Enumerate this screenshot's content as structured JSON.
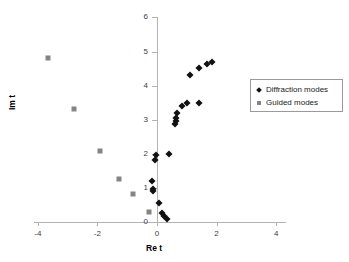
{
  "chart_data": {
    "type": "scatter",
    "title": "",
    "xlabel": "Re t",
    "ylabel": "Im t",
    "xlim": [
      -4,
      4
    ],
    "ylim": [
      0,
      6
    ],
    "xticks": [
      -4,
      -2,
      0,
      2,
      4
    ],
    "yticks": [
      0,
      1,
      2,
      3,
      4,
      5,
      6
    ],
    "xtick_labels": [
      "-4",
      "-2",
      "0",
      "2",
      "4"
    ],
    "ytick_labels": [
      "0",
      "1",
      "2",
      "3",
      "4",
      "5",
      "6"
    ],
    "grid": false,
    "legend_position": "right",
    "series": [
      {
        "name": "Diffraction modes",
        "marker": "diamond",
        "color": "#111111",
        "points": [
          [
            0.33,
            0.08
          ],
          [
            0.25,
            0.18
          ],
          [
            0.16,
            0.27
          ],
          [
            0.07,
            0.55
          ],
          [
            -0.12,
            0.9
          ],
          [
            -0.12,
            0.97
          ],
          [
            -0.16,
            1.21
          ],
          [
            -0.07,
            1.82
          ],
          [
            -0.04,
            1.97
          ],
          [
            0.4,
            1.99
          ],
          [
            0.62,
            2.88
          ],
          [
            0.63,
            2.97
          ],
          [
            0.63,
            3.05
          ],
          [
            0.68,
            3.21
          ],
          [
            0.85,
            3.39
          ],
          [
            1.0,
            3.48
          ],
          [
            1.4,
            3.49
          ],
          [
            1.12,
            4.31
          ],
          [
            1.4,
            4.51
          ],
          [
            1.68,
            4.63
          ],
          [
            1.84,
            4.69
          ]
        ]
      },
      {
        "name": "Guided modes",
        "marker": "square",
        "color": "#848484",
        "points": [
          [
            -3.67,
            4.82
          ],
          [
            -2.8,
            3.31
          ],
          [
            -1.92,
            2.08
          ],
          [
            -1.26,
            1.25
          ],
          [
            -0.8,
            0.82
          ],
          [
            -0.27,
            0.3
          ]
        ]
      }
    ]
  },
  "legend": {
    "entries": [
      {
        "label": "Diffraction modes"
      },
      {
        "label": "Guided modes"
      }
    ]
  }
}
